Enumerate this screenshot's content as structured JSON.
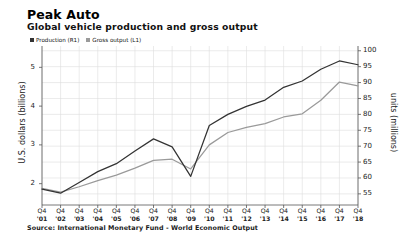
{
  "header": {
    "title": "Peak Auto",
    "subtitle": "Global vehicle production and gross output"
  },
  "footer": {
    "source": "Source: International Monetary Fund - World Economic Output"
  },
  "colors": {
    "production_line": "#333333",
    "gross_output_line": "#9a9a9a",
    "grid": "#dddddd",
    "axis": "#555555",
    "background": "#ffffff"
  },
  "chart_data": {
    "type": "line",
    "title": "Global vehicle production and gross output",
    "xlabel": "",
    "grid": true,
    "legend_position": "top-left",
    "quarter_prefix": "Q4",
    "categories": [
      "'01",
      "'02",
      "'03",
      "'04",
      "'05",
      "'06",
      "'07",
      "'08",
      "'09",
      "'10",
      "'11",
      "'12",
      "'13",
      "'14",
      "'15",
      "'16",
      "'17",
      "'18"
    ],
    "left_axis": {
      "label": "U.S. dollars (billions)",
      "ticks": [
        2,
        3,
        4,
        5
      ],
      "ylim": [
        1.45,
        5.55
      ],
      "series_ref": "Gross output (L1)"
    },
    "right_axis": {
      "label": "units (millions)",
      "ticks": [
        55,
        60,
        65,
        70,
        75,
        80,
        85,
        90,
        95,
        100
      ],
      "ylim": [
        51.5,
        101.5
      ],
      "series_ref": "Production (R1)"
    },
    "series": [
      {
        "name": "Production (R1)",
        "axis": "right",
        "unit": "millions of units",
        "color": "#333333",
        "values": [
          56.5,
          55.2,
          58.6,
          62.0,
          64.5,
          68.5,
          72.3,
          69.8,
          60.5,
          76.5,
          80.0,
          82.5,
          84.5,
          88.5,
          90.5,
          94.2,
          96.8,
          95.6
        ]
      },
      {
        "name": "Gross output (L1)",
        "axis": "left",
        "unit": "U.S. dollars (billions)",
        "color": "#9a9a9a",
        "values": [
          1.88,
          1.78,
          1.92,
          2.08,
          2.22,
          2.4,
          2.6,
          2.63,
          2.38,
          3.0,
          3.32,
          3.45,
          3.55,
          3.72,
          3.8,
          4.15,
          4.62,
          4.52
        ]
      }
    ],
    "legend": [
      {
        "label": "Production (R1)",
        "color": "#333333"
      },
      {
        "label": "Gross output (L1)",
        "color": "#9a9a9a"
      }
    ]
  }
}
